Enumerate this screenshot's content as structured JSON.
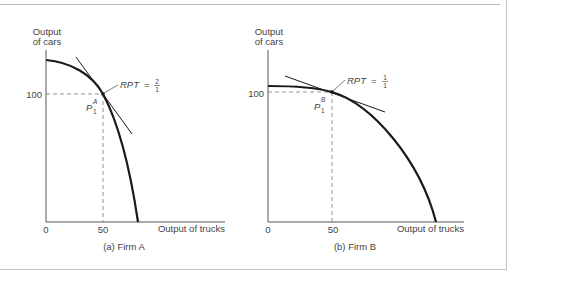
{
  "figure": {
    "panels": [
      {
        "id": "firm-a",
        "caption": "(a) Firm A",
        "y_axis_label_line1": "Output",
        "y_axis_label_line2": "of cars",
        "x_axis_label": "Output of trucks",
        "origin_label": "0",
        "x_tick_label": "50",
        "y_tick_label": "100",
        "point_label": "P",
        "point_superscript": "A",
        "point_subscript": "1",
        "rpt_label": "RPT",
        "rpt_equals": "=",
        "rpt_numerator": "2",
        "rpt_denominator": "1"
      },
      {
        "id": "firm-b",
        "caption": "(b) Firm B",
        "y_axis_label_line1": "Output",
        "y_axis_label_line2": "of cars",
        "x_axis_label": "Output of trucks",
        "origin_label": "0",
        "x_tick_label": "50",
        "y_tick_label": "100",
        "point_label": "P",
        "point_superscript": "B",
        "point_subscript": "1",
        "rpt_label": "RPT",
        "rpt_equals": "=",
        "rpt_numerator": "1",
        "rpt_denominator": "1"
      }
    ]
  },
  "colors": {
    "curve": "#1a1a1a",
    "axis": "#555555",
    "dashed": "#777777",
    "text": "#444444",
    "frame": "#c4c4c4"
  }
}
